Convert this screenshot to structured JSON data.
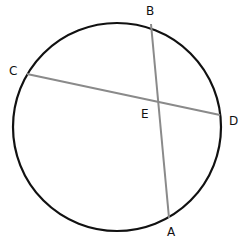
{
  "diagram": {
    "type": "circle-intersecting-chords",
    "colors": {
      "circle": "#111111",
      "chord": "#8a8a8a",
      "label": "#111111",
      "background": "#ffffff"
    },
    "circle": {
      "cx": 117,
      "cy": 127,
      "r": 104
    },
    "points": {
      "A": {
        "label": "A",
        "x": 169,
        "y": 218
      },
      "B": {
        "label": "B",
        "x": 151,
        "y": 24
      },
      "C": {
        "label": "C",
        "x": 27,
        "y": 74
      },
      "D": {
        "label": "D",
        "x": 220,
        "y": 115
      },
      "E": {
        "label": "E",
        "x": 157,
        "y": 101
      }
    },
    "chords": [
      {
        "name": "AB",
        "from": "A",
        "to": "B"
      },
      {
        "name": "CD",
        "from": "C",
        "to": "D"
      }
    ]
  }
}
